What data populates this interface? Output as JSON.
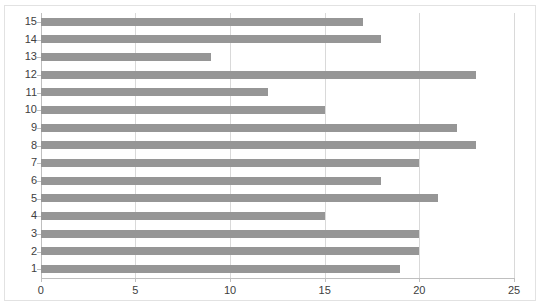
{
  "chart_data": {
    "type": "bar",
    "orientation": "horizontal",
    "title": "",
    "xlabel": "",
    "ylabel": "",
    "categories": [
      "1",
      "2",
      "3",
      "4",
      "5",
      "6",
      "7",
      "8",
      "9",
      "10",
      "11",
      "12",
      "13",
      "14",
      "15"
    ],
    "values": [
      19,
      20,
      20,
      15,
      21,
      18,
      20,
      23,
      22,
      15,
      12,
      23,
      9,
      18,
      17
    ],
    "xlim": [
      0,
      25
    ],
    "xticks": [
      0,
      5,
      10,
      15,
      20,
      25
    ],
    "xtick_labels": [
      "0",
      "5",
      "10",
      "15",
      "20",
      "25"
    ],
    "ytick_labels": [
      "15",
      "14",
      "13",
      "12",
      "11",
      "10",
      "9",
      "8",
      "7",
      "6",
      "5",
      "4",
      "3",
      "2",
      "1"
    ],
    "grid": "vertical",
    "legend": "none",
    "bar_color": "#969696",
    "gridline_color": "#d9d9d9",
    "axis_color": "#bfbfbf",
    "background_color": "#ffffff",
    "border_color": "#e2e2e2"
  },
  "title_strip": {
    "text": ""
  }
}
